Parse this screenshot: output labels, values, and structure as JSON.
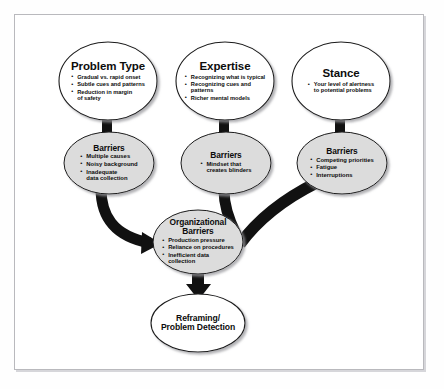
{
  "diagram": {
    "type": "flow-diagram",
    "nodes": {
      "problem_type": {
        "title": "Problem Type",
        "bullets": [
          "Gradual vs. rapid onset",
          "Subtle cues and patterns",
          "Reduction in margin",
          "of safety"
        ]
      },
      "expertise": {
        "title": "Expertise",
        "bullets": [
          "Recognizing what is typical",
          "Recognizing cues and",
          "patterns",
          "Richer mental models"
        ]
      },
      "stance": {
        "title": "Stance",
        "bullets": [
          "Your level of alertness",
          "to potential problems"
        ]
      },
      "barriers_left": {
        "title": "Barriers",
        "bullets": [
          "Multiple causes",
          "Noisy background",
          "Inadequate",
          "data collection"
        ]
      },
      "barriers_mid": {
        "title": "Barriers",
        "bullets": [
          "Mindset that",
          "creates blinders"
        ]
      },
      "barriers_right": {
        "title": "Barriers",
        "bullets": [
          "Competing priorities",
          "Fatigue",
          "Interruptions"
        ]
      },
      "organizational_barriers": {
        "title_line1": "Organizational",
        "title_line2": "Barriers",
        "bullets": [
          "Production pressure",
          "Reliance on procedures",
          "Inefficient data",
          "collection"
        ]
      },
      "reframing": {
        "title_line1": "Reframing/",
        "title_line2": "Problem Detection"
      }
    },
    "colors": {
      "oval_white_fill": "#ffffff",
      "oval_gray_fill": "#dcdcdc",
      "oval_stroke": "#1a1a1a",
      "connector": "#111111",
      "frame": "#b9b9bd",
      "text": "#0c0c0c"
    }
  }
}
